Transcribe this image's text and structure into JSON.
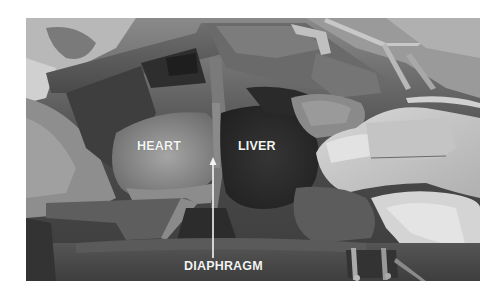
{
  "figure": {
    "type": "grayscale surgical photograph",
    "labels": {
      "heart": "HEART",
      "liver": "LIVER",
      "diaphragm": "DIAPHRAGM"
    },
    "annotations": [
      {
        "label": "HEART",
        "position": "center-left over heart"
      },
      {
        "label": "LIVER",
        "position": "center over liver"
      },
      {
        "label": "DIAPHRAGM",
        "position": "bottom center",
        "arrow": "vertical arrow pointing up to diaphragm"
      }
    ],
    "colors": {
      "background": "#ffffff",
      "label_text": "#f4f4f4",
      "arrow": "#f4f4f4"
    }
  }
}
